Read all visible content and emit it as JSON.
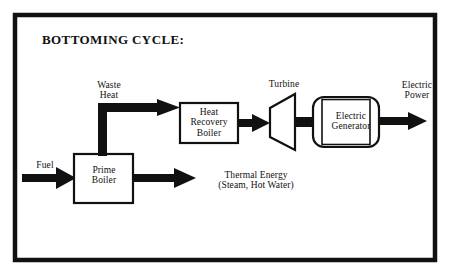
{
  "diagram": {
    "title": "BOTTOMING CYCLE:",
    "frame": {
      "stroke": "#111111"
    },
    "ink_color": "#111111",
    "background": "#ffffff",
    "nodes": {
      "prime_boiler": {
        "label": "Prime\nBoiler",
        "shape": "rectangle"
      },
      "heat_recovery_boiler": {
        "label": "Heat\nRecovery\nBoiler",
        "shape": "rectangle"
      },
      "turbine": {
        "label": "Turbine",
        "shape": "trapezoid"
      },
      "electric_generator": {
        "label": "Electric\nGenerator",
        "shape": "rounded-capsule"
      }
    },
    "flows": {
      "fuel": "Fuel",
      "waste_heat": "Waste\nHeat",
      "thermal_energy": "Thermal Energy\n(Steam, Hot Water)",
      "electric_power": "Electric\nPower"
    }
  }
}
